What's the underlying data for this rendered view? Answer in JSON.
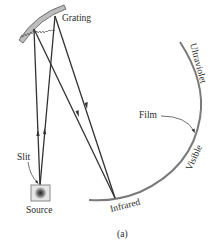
{
  "diagram": {
    "type": "grating spectrograph schematic",
    "caption": "(a)",
    "labels": {
      "grating": "Grating",
      "slit": "Slit",
      "source": "Source",
      "film": "Film",
      "ultraviolet": "Ultraviolet",
      "visible": "Visible",
      "infrared": "Infrared"
    },
    "colors": {
      "ray": "#333333",
      "film": "#7a7a7a",
      "grating_fill": "#b5b5b5",
      "source_box": "#9a9a9a",
      "text": "#2a2a2a"
    }
  }
}
